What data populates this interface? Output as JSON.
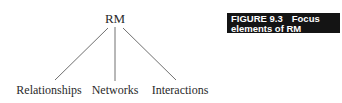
{
  "diagram": {
    "root": "RM",
    "children": [
      "Relationships",
      "Networks",
      "Interactions"
    ]
  },
  "caption": {
    "number": "FIGURE 9.3",
    "title_line1": "Focus",
    "title_line2": "elements of RM"
  },
  "colors": {
    "line": "#707070",
    "caption_bg": "#141414",
    "caption_text": "#ffffff"
  }
}
